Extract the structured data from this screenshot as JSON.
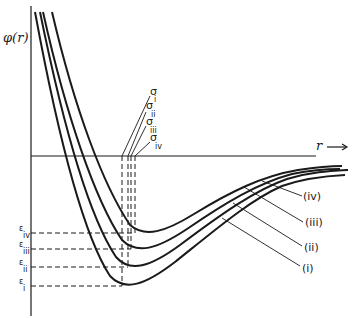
{
  "diagram": {
    "y_axis_label": "φ(r)",
    "x_axis_label": "r",
    "x_axis_arrow": "→",
    "curves": [
      {
        "id": "i",
        "label": "(i)",
        "sigma_sub": "i",
        "epsilon_sub": "i"
      },
      {
        "id": "ii",
        "label": "(ii)",
        "sigma_sub": "ii",
        "epsilon_sub": "ii"
      },
      {
        "id": "iii",
        "label": "(iii)",
        "sigma_sub": "iii",
        "epsilon_sub": "iii"
      },
      {
        "id": "iv",
        "label": "(iv)",
        "sigma_sub": "iv",
        "epsilon_sub": "iv"
      }
    ],
    "sigma_symbol": "σ",
    "epsilon_symbol": "ε"
  }
}
